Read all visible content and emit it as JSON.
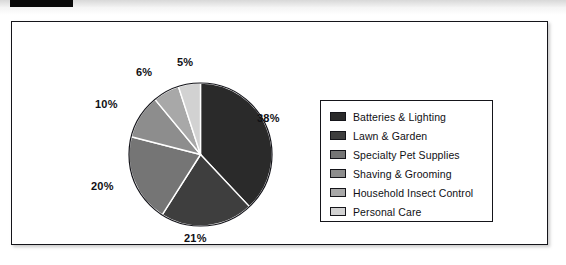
{
  "artifacts": {
    "top_bar_color": "#0a0a0a",
    "scan_strip_color": "#e6e6e6"
  },
  "chart_data": {
    "type": "pie",
    "title": "",
    "subtitle": "",
    "xlabel": "",
    "ylabel": "",
    "grid": false,
    "legend_position": "right",
    "start_angle_deg": 0,
    "direction": "clockwise",
    "units": "percent",
    "total": 100,
    "categories": [
      "Batteries & Lighting",
      "Lawn & Garden",
      "Specialty Pet Supplies",
      "Shaving & Grooming",
      "Household Insect Control",
      "Personal Care"
    ],
    "values": [
      38,
      21,
      20,
      10,
      6,
      5
    ],
    "data_labels": [
      "38%",
      "21%",
      "20%",
      "10%",
      "6%",
      "5%"
    ],
    "colors": [
      "#2a2a2a",
      "#3e3e3e",
      "#757575",
      "#8d8d8d",
      "#a8a8a8",
      "#d2d2d2"
    ],
    "slice_border_color": "#ffffff",
    "slices": [
      {
        "label": "Batteries & Lighting",
        "value": 38,
        "data_label": "38%",
        "color": "#2a2a2a"
      },
      {
        "label": "Lawn & Garden",
        "value": 21,
        "data_label": "21%",
        "color": "#3e3e3e"
      },
      {
        "label": "Specialty Pet Supplies",
        "value": 20,
        "data_label": "20%",
        "color": "#757575"
      },
      {
        "label": "Shaving & Grooming",
        "value": 10,
        "data_label": "10%",
        "color": "#8d8d8d"
      },
      {
        "label": "Household Insect Control",
        "value": 6,
        "data_label": "6%",
        "color": "#a8a8a8"
      },
      {
        "label": "Personal Care",
        "value": 5,
        "data_label": "5%",
        "color": "#d2d2d2"
      }
    ]
  },
  "legend": {
    "items": [
      {
        "label": "Batteries & Lighting",
        "color": "#2a2a2a"
      },
      {
        "label": "Lawn & Garden",
        "color": "#3e3e3e"
      },
      {
        "label": "Specialty Pet Supplies",
        "color": "#757575"
      },
      {
        "label": "Shaving & Grooming",
        "color": "#8d8d8d"
      },
      {
        "label": "Household Insect Control",
        "color": "#a8a8a8"
      },
      {
        "label": "Personal Care",
        "color": "#d2d2d2"
      }
    ]
  }
}
